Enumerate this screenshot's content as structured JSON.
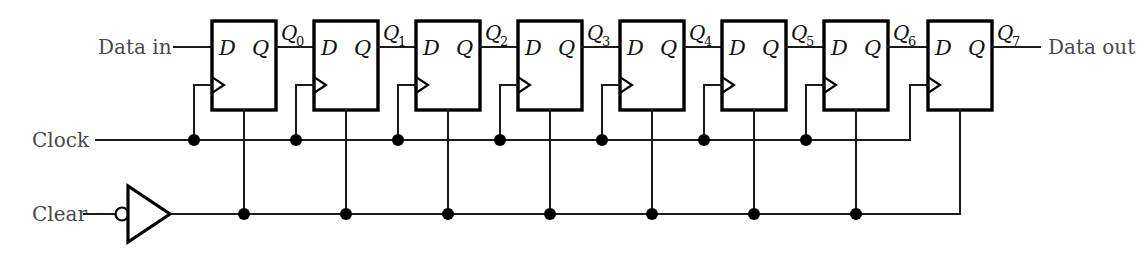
{
  "diagram": {
    "type": "digital-logic-schematic",
    "colors": {
      "wire": "#1b1b1b",
      "box_stroke": "#000000",
      "background": "#ffffff",
      "label_text": "#4a4a4a"
    },
    "inputs": {
      "data_in_label": "Data in",
      "clock_label": "Clock",
      "clear_label": "Clear"
    },
    "outputs": {
      "data_out_label": "Data out"
    },
    "flipflops": [
      {
        "index": 0,
        "d_label": "D",
        "q_label": "Q",
        "clock_icon": "clock-triangle-icon",
        "output_name": "Q",
        "output_subscript": "0"
      },
      {
        "index": 1,
        "d_label": "D",
        "q_label": "Q",
        "clock_icon": "clock-triangle-icon",
        "output_name": "Q",
        "output_subscript": "1"
      },
      {
        "index": 2,
        "d_label": "D",
        "q_label": "Q",
        "clock_icon": "clock-triangle-icon",
        "output_name": "Q",
        "output_subscript": "2"
      },
      {
        "index": 3,
        "d_label": "D",
        "q_label": "Q",
        "clock_icon": "clock-triangle-icon",
        "output_name": "Q",
        "output_subscript": "3"
      },
      {
        "index": 4,
        "d_label": "D",
        "q_label": "Q",
        "clock_icon": "clock-triangle-icon",
        "output_name": "Q",
        "output_subscript": "4"
      },
      {
        "index": 5,
        "d_label": "D",
        "q_label": "Q",
        "clock_icon": "clock-triangle-icon",
        "output_name": "Q",
        "output_subscript": "5"
      },
      {
        "index": 6,
        "d_label": "D",
        "q_label": "Q",
        "clock_icon": "clock-triangle-icon",
        "output_name": "Q",
        "output_subscript": "6"
      },
      {
        "index": 7,
        "d_label": "D",
        "q_label": "Q",
        "clock_icon": "clock-triangle-icon",
        "output_name": "Q",
        "output_subscript": "7"
      }
    ],
    "inverter": {
      "icon": "inverter-gate-icon",
      "bubble": "inverting-bubble-icon"
    },
    "bus_junction_count": {
      "clock": 7,
      "clear": 7
    }
  }
}
